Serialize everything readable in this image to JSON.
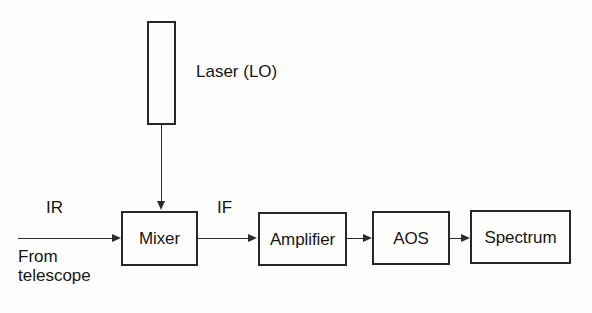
{
  "diagram": {
    "background_color": "#fdfdfc",
    "line_color": "#2c2c2c",
    "text_color": "#161616",
    "blocks": [
      {
        "id": "laser",
        "label": "",
        "caption": "Laser (LO)"
      },
      {
        "id": "mixer",
        "label": "Mixer"
      },
      {
        "id": "amplifier",
        "label": "Amplifier"
      },
      {
        "id": "aos",
        "label": "AOS"
      },
      {
        "id": "spectrum",
        "label": "Spectrum"
      }
    ],
    "labels": {
      "laser_caption": "Laser (LO)",
      "ir": "IR",
      "if": "IF",
      "from_telescope_line1": "From",
      "from_telescope_line2": "telescope"
    },
    "connections": [
      {
        "id": "input-signal",
        "from": "telescope",
        "to": "mixer",
        "label": "IR",
        "direction": "right"
      },
      {
        "id": "lo-signal",
        "from": "laser",
        "to": "mixer",
        "label": "",
        "direction": "down"
      },
      {
        "id": "if-signal",
        "from": "mixer",
        "to": "amplifier",
        "label": "IF",
        "direction": "right"
      },
      {
        "id": "amp-to-aos",
        "from": "amplifier",
        "to": "aos",
        "label": "",
        "direction": "right"
      },
      {
        "id": "aos-to-spec",
        "from": "aos",
        "to": "spectrum",
        "label": "",
        "direction": "right"
      }
    ]
  }
}
